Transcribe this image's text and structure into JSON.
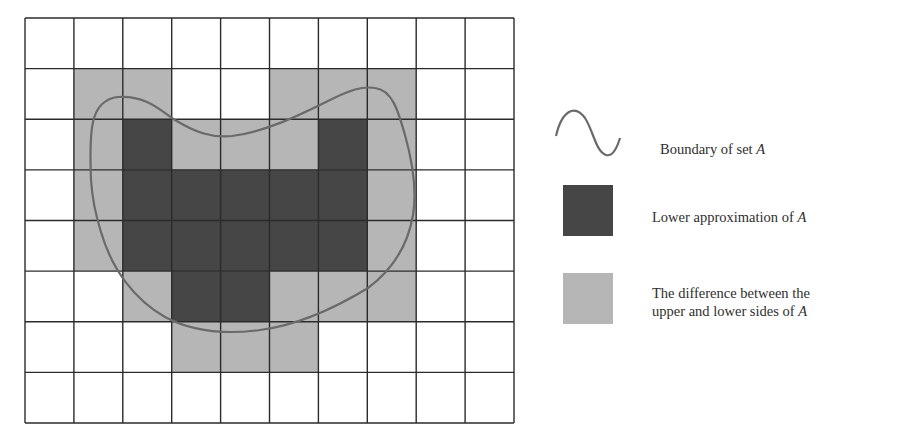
{
  "figure": {
    "grid": {
      "cols": 10,
      "rows": 8,
      "x0": 25,
      "y0": 18,
      "x1": 514,
      "y1": 423,
      "cells": [
        "WWWWWWWWWW",
        "WGGWWGGGWW",
        "WGDGGGDGWW",
        "WGDDDDDGWW",
        "WGDDDDDGWW",
        "WWGDDGGGWW",
        "WWWGGGWWWW",
        "WWWWWWWWWW"
      ]
    },
    "colors": {
      "white": "#ffffff",
      "lower_approximation": "#464646",
      "boundary_region": "#b6b6b6",
      "grid_line": "#2b2b2b",
      "boundary_curve": "#6a6a6a"
    },
    "boundary_curve_path": "M 91 180 C 89 130, 90 100, 118 97 C 145 95, 160 110, 175 120 C 195 132, 210 138, 232 136 C 265 132, 300 115, 330 100 C 350 90, 362 86, 375 88 C 392 90, 398 110, 405 135 C 412 160, 417 190, 413 215 C 408 245, 392 270, 368 288 C 340 305, 300 325, 260 330 C 230 334, 195 333, 165 317 C 135 300, 112 270, 101 232 C 94 210, 92 195, 91 180 Z"
  },
  "legend": {
    "items": [
      {
        "symbol": "wave-line",
        "label": "Boundary of set ",
        "italic": "A"
      },
      {
        "symbol": "dark-square",
        "label": "Lower approximation of ",
        "italic": "A"
      },
      {
        "symbol": "light-square",
        "label_line1": "The difference between the",
        "label_line2": "upper and lower sides of ",
        "italic": "A"
      }
    ]
  }
}
